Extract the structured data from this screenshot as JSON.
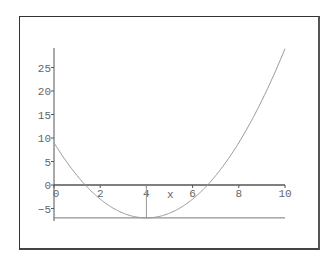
{
  "chart_data": {
    "type": "line",
    "title": "",
    "xlabel": "x",
    "ylabel": "",
    "function": "(x-4)^2 - 7",
    "xlim": [
      0,
      10
    ],
    "ylim": [
      -7,
      29
    ],
    "x_ticks": [
      "0",
      "2",
      "4",
      "6",
      "8",
      "10"
    ],
    "y_ticks": [
      "-5",
      "0",
      "5",
      "10",
      "15",
      "20",
      "25"
    ],
    "grid": false,
    "legend": null,
    "series": [
      {
        "name": "parabola",
        "x": [
          0,
          1,
          2,
          3,
          4,
          5,
          6,
          7,
          8,
          9,
          10
        ],
        "values": [
          9,
          2,
          -3,
          -6,
          -7,
          -6,
          -3,
          2,
          9,
          18,
          29
        ]
      }
    ],
    "annotations": [
      {
        "type": "vertical-line",
        "x": 4,
        "from_y": -7,
        "to_y": 0,
        "label": "minimum at x=4"
      },
      {
        "type": "horizontal-line",
        "y": -7,
        "from_x": 0,
        "to_x": 10,
        "label": "minimum value -7"
      }
    ],
    "colors": {
      "curve": "#888888",
      "axis": "#555555",
      "frame": "#333333"
    }
  }
}
